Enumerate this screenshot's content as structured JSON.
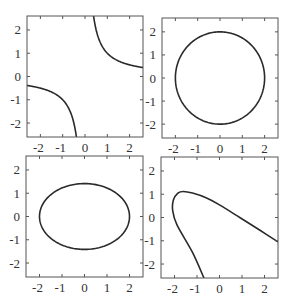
{
  "figure": {
    "background": "#ffffff",
    "axis_color": "#555555",
    "curve_color": "#2a2a2a",
    "tick_label_color": "#333333"
  },
  "chart_data": [
    {
      "type": "line",
      "panel": "top-left",
      "title": "",
      "xlabel": "",
      "ylabel": "",
      "xlim": [
        -2.6,
        2.6
      ],
      "ylim": [
        -2.6,
        2.6
      ],
      "xticks": [
        -2,
        -1,
        0,
        1,
        2
      ],
      "yticks": [
        -2,
        -1,
        0,
        1,
        2
      ],
      "xtick_labels": [
        "-2",
        "-1",
        "0",
        "1",
        "2"
      ],
      "ytick_labels": [
        "-2",
        "-1",
        "0",
        "1",
        "2"
      ],
      "show_xtick_labels": true,
      "show_ytick_labels": true,
      "grid": false,
      "curve": "hyperbola",
      "equation": "xy = 1",
      "box": {
        "left": 27,
        "top": 16,
        "right": 143,
        "bottom": 137
      }
    },
    {
      "type": "line",
      "panel": "top-right",
      "title": "",
      "xlabel": "",
      "ylabel": "",
      "xlim": [
        -2.6,
        2.6
      ],
      "ylim": [
        -2.6,
        2.6
      ],
      "xticks": [
        -2,
        -1,
        0,
        1,
        2
      ],
      "yticks": [
        -2,
        -1,
        0,
        1,
        2
      ],
      "xtick_labels": [
        "-2",
        "-1",
        "0",
        "1",
        "2"
      ],
      "ytick_labels": [
        "-2",
        "-1",
        "0",
        "1",
        "2"
      ],
      "show_xtick_labels": true,
      "show_ytick_labels": true,
      "grid": false,
      "curve": "circle",
      "equation": "x^2 + y^2 = 4",
      "box": {
        "left": 162,
        "top": 18,
        "right": 278,
        "bottom": 138
      }
    },
    {
      "type": "line",
      "panel": "bottom-left",
      "title": "",
      "xlabel": "",
      "ylabel": "",
      "xlim": [
        -2.6,
        2.6
      ],
      "ylim": [
        -2.6,
        2.6
      ],
      "xticks": [
        -2,
        -1,
        0,
        1,
        2
      ],
      "yticks": [
        -2,
        -1,
        0,
        1,
        2
      ],
      "xtick_labels": [
        "-2",
        "-1",
        "0",
        "1",
        "2"
      ],
      "ytick_labels": [
        "-2",
        "-1",
        "0",
        "1",
        "2"
      ],
      "show_xtick_labels": true,
      "show_ytick_labels": true,
      "grid": false,
      "curve": "ellipse",
      "equation": "x^2/4 + y^2/2 = 1",
      "box": {
        "left": 26,
        "top": 156,
        "right": 143,
        "bottom": 277
      }
    },
    {
      "type": "line",
      "panel": "bottom-right",
      "title": "",
      "xlabel": "",
      "ylabel": "",
      "xlim": [
        -2.6,
        2.6
      ],
      "ylim": [
        -2.6,
        2.6
      ],
      "xticks": [
        -2,
        -1,
        0,
        1,
        2
      ],
      "yticks": [
        -2,
        -1,
        0,
        1,
        2
      ],
      "xtick_labels": [
        "-2",
        "-1",
        "0",
        "1",
        "2"
      ],
      "ytick_labels": [
        "-2",
        "-1",
        "0",
        "1",
        "2"
      ],
      "show_xtick_labels": true,
      "show_ytick_labels": true,
      "grid": false,
      "curve": "parabola",
      "points": [
        [
          -0.69,
          -2.6
        ],
        [
          -1.2,
          -1.5
        ],
        [
          -1.89,
          -0.32
        ],
        [
          -2.08,
          0.3
        ],
        [
          -2.05,
          0.75
        ],
        [
          -1.85,
          1.05
        ],
        [
          -1.6,
          1.12
        ],
        [
          -1.2,
          1.05
        ],
        [
          -0.6,
          0.85
        ],
        [
          0.0,
          0.54
        ],
        [
          0.9,
          0.0
        ],
        [
          1.8,
          -0.55
        ],
        [
          2.6,
          -1.05
        ]
      ],
      "box": {
        "left": 161,
        "top": 157,
        "right": 278,
        "bottom": 278
      }
    }
  ]
}
